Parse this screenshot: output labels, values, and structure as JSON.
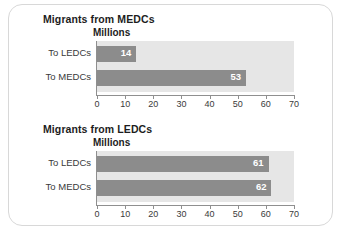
{
  "chart_data": [
    {
      "type": "bar",
      "orientation": "horizontal",
      "title": "Migrants from MEDCs",
      "unit_label": "Millions",
      "categories": [
        "To LEDCs",
        "To MEDCs"
      ],
      "values": [
        14,
        53
      ],
      "xlabel": "",
      "ylabel": "",
      "xlim": [
        0,
        70
      ],
      "xticks": [
        0,
        10,
        20,
        30,
        40,
        50,
        60,
        70
      ],
      "grid": false,
      "legend": false,
      "bar_color": "#8c8c8c",
      "plot_background": "#e6e6e6",
      "value_label_color": "#ffffff"
    },
    {
      "type": "bar",
      "orientation": "horizontal",
      "title": "Migrants from LEDCs",
      "unit_label": "Millions",
      "categories": [
        "To LEDCs",
        "To MEDCs"
      ],
      "values": [
        61,
        62
      ],
      "xlabel": "",
      "ylabel": "",
      "xlim": [
        0,
        70
      ],
      "xticks": [
        0,
        10,
        20,
        30,
        40,
        50,
        60,
        70
      ],
      "grid": false,
      "legend": false,
      "bar_color": "#8c8c8c",
      "plot_background": "#e6e6e6",
      "value_label_color": "#ffffff"
    }
  ]
}
